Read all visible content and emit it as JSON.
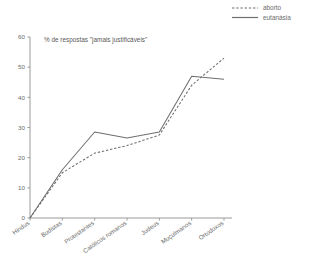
{
  "chart_data": {
    "type": "line",
    "title": "% de respostas \"jamais justificáveis\"",
    "xlabel": "",
    "ylabel": "",
    "ylim": [
      0,
      60
    ],
    "yticks": [
      0,
      10,
      20,
      30,
      40,
      50,
      60
    ],
    "grid": false,
    "legend_position": "top-right",
    "categories": [
      "Hindus",
      "Budistas",
      "Protestantes",
      "Católicos romanos",
      "Judeus",
      "Muçulmanos",
      "Ortodoxos"
    ],
    "series": [
      {
        "name": "aborto",
        "style": "dashed",
        "color": "#6e6e6e",
        "values": [
          0,
          15,
          21.5,
          24,
          27.5,
          44,
          53
        ]
      },
      {
        "name": "eutanásia",
        "style": "solid",
        "color": "#6e6e6e",
        "values": [
          0,
          16,
          28.5,
          26.5,
          28.5,
          47,
          46
        ]
      }
    ]
  },
  "legend": {
    "items": [
      {
        "label": "aborto",
        "style": "dashed"
      },
      {
        "label": "eutanásia",
        "style": "solid"
      }
    ]
  },
  "axis": {
    "y_tick_labels": [
      "0",
      "10",
      "20",
      "30",
      "40",
      "50",
      "60"
    ]
  }
}
